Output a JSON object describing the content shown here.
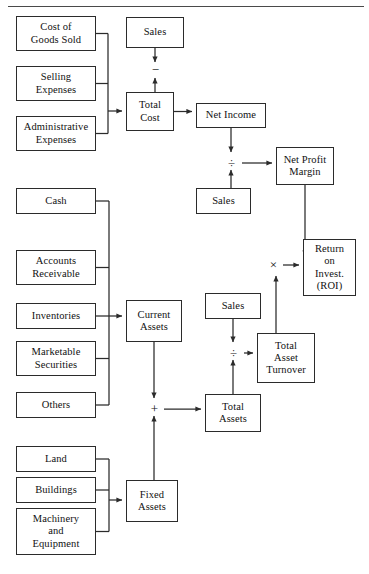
{
  "diagram": {
    "type": "flowchart",
    "top_rule": true,
    "line_color": "#2b2b2b",
    "background": "#ffffff",
    "nodes": [
      {
        "id": "cogs",
        "label": "Cost of\nGoods Sold",
        "x": 16,
        "y": 16,
        "w": 80,
        "h": 35
      },
      {
        "id": "selling",
        "label": "Selling\nExpenses",
        "x": 16,
        "y": 66,
        "w": 80,
        "h": 35
      },
      {
        "id": "admin",
        "label": "Administrative\nExpenses",
        "x": 16,
        "y": 116,
        "w": 80,
        "h": 35
      },
      {
        "id": "cash",
        "label": "Cash",
        "x": 16,
        "y": 188,
        "w": 80,
        "h": 26
      },
      {
        "id": "accounts_rec",
        "label": "Accounts\nReceivable",
        "x": 16,
        "y": 250,
        "w": 80,
        "h": 35
      },
      {
        "id": "inventories",
        "label": "Inventories",
        "x": 16,
        "y": 303,
        "w": 80,
        "h": 26
      },
      {
        "id": "marketable",
        "label": "Marketable\nSecurities",
        "x": 16,
        "y": 341,
        "w": 80,
        "h": 35
      },
      {
        "id": "others",
        "label": "Others",
        "x": 16,
        "y": 392,
        "w": 80,
        "h": 26
      },
      {
        "id": "land",
        "label": "Land",
        "x": 16,
        "y": 446,
        "w": 80,
        "h": 26
      },
      {
        "id": "buildings",
        "label": "Buildings",
        "x": 16,
        "y": 477,
        "w": 80,
        "h": 26
      },
      {
        "id": "machinery",
        "label": "Machinery\nand\nEquipment",
        "x": 16,
        "y": 508,
        "w": 80,
        "h": 47
      },
      {
        "id": "sales_top",
        "label": "Sales",
        "x": 126,
        "y": 17,
        "w": 58,
        "h": 31
      },
      {
        "id": "total_cost",
        "label": "Total\nCost",
        "x": 126,
        "y": 92,
        "w": 48,
        "h": 39
      },
      {
        "id": "net_income",
        "label": "Net Income",
        "x": 196,
        "y": 103,
        "w": 70,
        "h": 25
      },
      {
        "id": "sales_mid",
        "label": "Sales",
        "x": 196,
        "y": 188,
        "w": 55,
        "h": 26
      },
      {
        "id": "net_profit",
        "label": "Net Profit\nMargin",
        "x": 276,
        "y": 147,
        "w": 58,
        "h": 38
      },
      {
        "id": "roi",
        "label": "Return\non\nInvest.\n(ROI)",
        "x": 303,
        "y": 239,
        "w": 53,
        "h": 57
      },
      {
        "id": "current_assets",
        "label": "Current\nAssets",
        "x": 126,
        "y": 300,
        "w": 56,
        "h": 42
      },
      {
        "id": "sales_low",
        "label": "Sales",
        "x": 205,
        "y": 293,
        "w": 56,
        "h": 26
      },
      {
        "id": "total_turnover",
        "label": "Total\nAsset\nTurnover",
        "x": 257,
        "y": 333,
        "w": 58,
        "h": 50
      },
      {
        "id": "total_assets",
        "label": "Total\nAssets",
        "x": 205,
        "y": 394,
        "w": 56,
        "h": 38
      },
      {
        "id": "fixed_assets",
        "label": "Fixed\nAssets",
        "x": 126,
        "y": 480,
        "w": 52,
        "h": 42
      }
    ],
    "operators": [
      {
        "id": "minus",
        "symbol": "−",
        "x": 150,
        "y": 68
      },
      {
        "id": "divide1",
        "symbol": "÷",
        "x": 231,
        "y": 160
      },
      {
        "id": "times",
        "symbol": "×",
        "x": 272,
        "y": 262
      },
      {
        "id": "divide2",
        "symbol": "÷",
        "x": 233,
        "y": 350
      },
      {
        "id": "plus",
        "symbol": "+",
        "x": 152,
        "y": 406
      }
    ],
    "groups": [
      {
        "id": "cost-group",
        "label": "cost inputs",
        "members": [
          "cogs",
          "selling",
          "admin"
        ],
        "target": "total_cost"
      },
      {
        "id": "current-group",
        "label": "current assets inputs",
        "members": [
          "cash",
          "accounts_rec",
          "inventories",
          "marketable",
          "others"
        ],
        "target": "current_assets"
      },
      {
        "id": "fixed-group",
        "label": "fixed assets inputs",
        "members": [
          "land",
          "buildings",
          "machinery"
        ],
        "target": "fixed_assets"
      }
    ]
  }
}
